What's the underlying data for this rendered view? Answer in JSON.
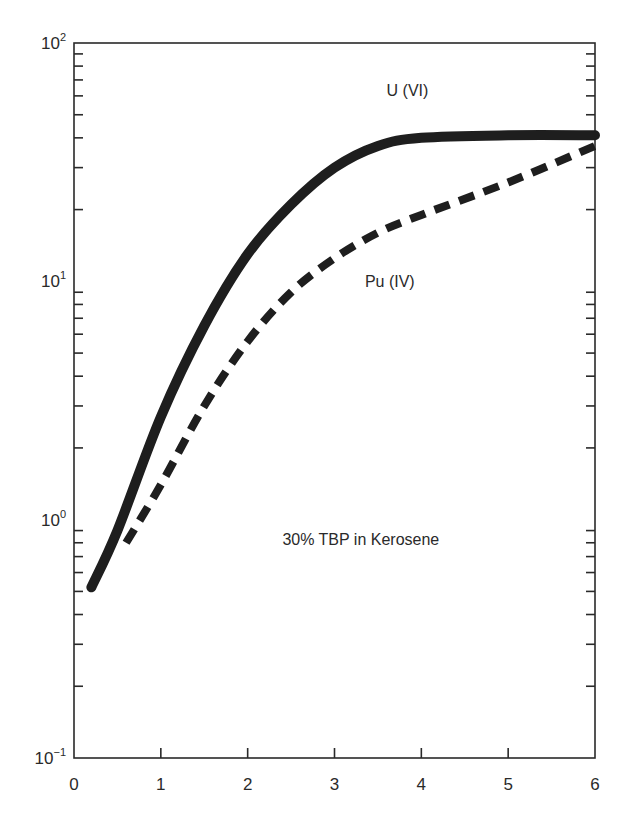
{
  "chart_data": {
    "type": "line",
    "title": "",
    "xlabel": "",
    "ylabel": "",
    "xlim": [
      0,
      6
    ],
    "ylim": [
      0.1,
      100
    ],
    "yscale": "log",
    "grid": false,
    "x_ticks": [
      "0",
      "1",
      "2",
      "3",
      "4",
      "5",
      "6"
    ],
    "y_ticks": [
      {
        "base": "10",
        "exp": "2",
        "value": 100
      },
      {
        "base": "10",
        "exp": "1",
        "value": 10
      },
      {
        "base": "10",
        "exp": "0",
        "value": 1
      },
      {
        "base": "10",
        "exp": "−1",
        "value": 0.1
      }
    ],
    "series": [
      {
        "name": "U (VI)",
        "style": "solid",
        "x": [
          0.2,
          0.5,
          1.0,
          1.5,
          2.0,
          2.5,
          3.0,
          3.5,
          4.0,
          5.0,
          6.0
        ],
        "values": [
          0.52,
          0.9,
          2.7,
          6.5,
          13,
          21,
          30,
          37,
          40,
          41,
          41
        ]
      },
      {
        "name": "Pu (IV)",
        "style": "dashed",
        "x": [
          0.6,
          1.0,
          1.5,
          2.0,
          2.5,
          3.0,
          3.5,
          4.0,
          5.0,
          6.0
        ],
        "values": [
          0.8,
          1.4,
          3.0,
          5.6,
          9.0,
          12.5,
          16,
          19,
          26,
          37
        ]
      }
    ],
    "annotations": [
      {
        "text": "U (VI)",
        "x": 3.6,
        "y": 60
      },
      {
        "text": "Pu (IV)",
        "x": 3.35,
        "y": 9.5
      },
      {
        "text": "30% TBP in Kerosene",
        "x": 2.4,
        "y": 0.78
      }
    ],
    "legend": "none (inline curve labels)"
  },
  "labels": {
    "u_curve": "U (VI)",
    "pu_curve": "Pu (IV)",
    "condition": "30% TBP in Kerosene"
  },
  "colors": {
    "ink": "#1e1e1e",
    "axis": "#2a2a2a",
    "background": "#ffffff"
  }
}
